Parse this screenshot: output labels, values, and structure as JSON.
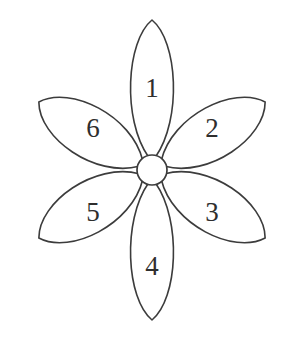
{
  "diagram": {
    "background_color": "#ffffff",
    "stroke_color": "#3c3c3c",
    "fill_color": "#ffffff",
    "text_color": "#2e2e2e",
    "center": {
      "name": "center-circle",
      "cx": 152,
      "cy": 170,
      "r": 15
    },
    "petals": [
      {
        "label": "1",
        "angle_deg": -90,
        "label_x": 152,
        "label_y": 88,
        "tip_length": 150,
        "half_width": 30
      },
      {
        "label": "2",
        "angle_deg": -31,
        "label_x": 212,
        "label_y": 128,
        "tip_length": 132,
        "half_width": 36
      },
      {
        "label": "3",
        "angle_deg": 31,
        "label_x": 212,
        "label_y": 212,
        "tip_length": 132,
        "half_width": 36
      },
      {
        "label": "4",
        "angle_deg": 90,
        "label_x": 152,
        "label_y": 266,
        "tip_length": 150,
        "half_width": 30
      },
      {
        "label": "5",
        "angle_deg": 149,
        "label_x": 93,
        "label_y": 212,
        "tip_length": 132,
        "half_width": 36
      },
      {
        "label": "6",
        "angle_deg": -149,
        "label_x": 93,
        "label_y": 128,
        "tip_length": 132,
        "half_width": 36
      }
    ]
  }
}
